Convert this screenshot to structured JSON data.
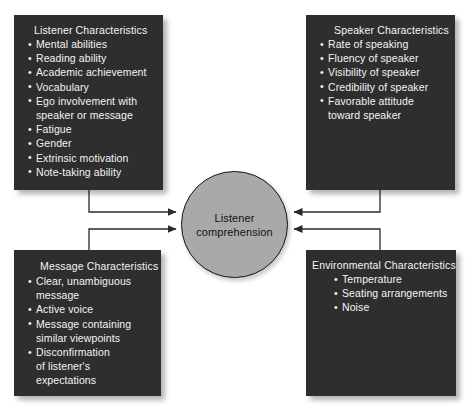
{
  "diagram": {
    "center": {
      "label_line1": "Listener",
      "label_line2": "comprehension",
      "fill_color": "#a9a9a9",
      "text_color": "#111111"
    },
    "style": {
      "box_fill": "#2e2e2e",
      "box_text": "#f4f4f4",
      "connector_color": "#2a2a2a",
      "background": "#ffffff"
    },
    "boxes": [
      {
        "id": "listener",
        "position": "top-left",
        "title": "Listener Characteristics",
        "items": [
          {
            "text": "Mental abilities",
            "continuation": ""
          },
          {
            "text": "Reading ability",
            "continuation": ""
          },
          {
            "text": "Academic achievement",
            "continuation": ""
          },
          {
            "text": "Vocabulary",
            "continuation": ""
          },
          {
            "text": "Ego involvement with",
            "continuation": "speaker or message"
          },
          {
            "text": "Fatigue",
            "continuation": ""
          },
          {
            "text": "Gender",
            "continuation": ""
          },
          {
            "text": "Extrinsic motivation",
            "continuation": ""
          },
          {
            "text": "Note-taking ability",
            "continuation": ""
          }
        ]
      },
      {
        "id": "speaker",
        "position": "top-right",
        "title": "Speaker Characteristics",
        "items": [
          {
            "text": "Rate of speaking",
            "continuation": ""
          },
          {
            "text": "Fluency of speaker",
            "continuation": ""
          },
          {
            "text": "Visibility of speaker",
            "continuation": ""
          },
          {
            "text": "Credibility of speaker",
            "continuation": ""
          },
          {
            "text": "Favorable attitude",
            "continuation": "toward speaker"
          }
        ]
      },
      {
        "id": "message",
        "position": "bottom-left",
        "title": "Message Characteristics",
        "items": [
          {
            "text": "Clear, unambiguous",
            "continuation": "message"
          },
          {
            "text": "Active voice",
            "continuation": ""
          },
          {
            "text": "Message containing",
            "continuation": "similar viewpoints"
          },
          {
            "text": "Disconfirmation",
            "continuation": "of listener's",
            "continuation2": "expectations"
          }
        ]
      },
      {
        "id": "environmental",
        "position": "bottom-right",
        "title": "Environmental Characteristics",
        "items": [
          {
            "text": "Temperature",
            "continuation": ""
          },
          {
            "text": "Seating arrangements",
            "continuation": ""
          },
          {
            "text": "Noise",
            "continuation": ""
          }
        ]
      }
    ],
    "bullet_glyph": "•",
    "connectors": [
      {
        "from": "listener",
        "to": "center",
        "arrow": "right"
      },
      {
        "from": "message",
        "to": "center",
        "arrow": "right"
      },
      {
        "from": "speaker",
        "to": "center",
        "arrow": "left"
      },
      {
        "from": "environmental",
        "to": "center",
        "arrow": "left"
      }
    ]
  }
}
